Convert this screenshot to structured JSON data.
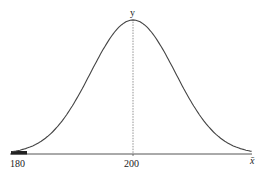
{
  "chart_data": {
    "type": "line",
    "title": "",
    "xlabel": "x̄",
    "ylabel": "y",
    "x_ticks": [
      180,
      200
    ],
    "x_tick_labels": [
      "180",
      "200"
    ],
    "mean": 200,
    "approx_sd": 7.5,
    "xlim": [
      178.5,
      221
    ],
    "shaded_region": {
      "from": 178.5,
      "to": 181,
      "side": "left tail",
      "color": "#222222"
    },
    "center_line": {
      "x": 200,
      "style": "dashed"
    },
    "grid": false,
    "legend": null
  },
  "labels": {
    "x_axis": "x̄",
    "y_axis": "y",
    "tick_180": "180",
    "tick_200": "200"
  },
  "colors": {
    "curve": "#444444",
    "axis": "#555555",
    "shade": "#222222",
    "center_line": "#777777"
  }
}
